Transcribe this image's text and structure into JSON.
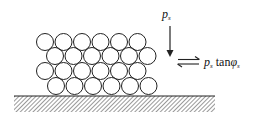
{
  "diagram": {
    "type": "particle-stack-on-surface",
    "circle_rows": [
      {
        "y": 42,
        "cx": [
          45,
          63.5,
          82,
          100.5,
          119,
          137.5
        ]
      },
      {
        "y": 56,
        "cx": [
          55,
          73.5,
          92,
          110.5,
          129,
          147.5
        ]
      },
      {
        "y": 71,
        "cx": [
          45,
          63.5,
          82,
          100.5,
          119,
          137.5
        ]
      },
      {
        "y": 86,
        "cx": [
          56,
          74.5,
          93,
          111.5,
          130,
          148.5
        ]
      }
    ],
    "circle_radius": 8.5,
    "ground": {
      "x1": 14,
      "x2": 215,
      "y": 96,
      "hatch_bottom": 112
    },
    "normal_load": {
      "symbol": "p",
      "subscript": "s"
    },
    "shear_label": {
      "symbol": "p",
      "subscript": "s",
      "function": "tan",
      "angle": "φ",
      "angle_subscript": "s"
    },
    "colors": {
      "stroke": "#222222",
      "hatch": "#555555",
      "background": "#ffffff"
    }
  }
}
